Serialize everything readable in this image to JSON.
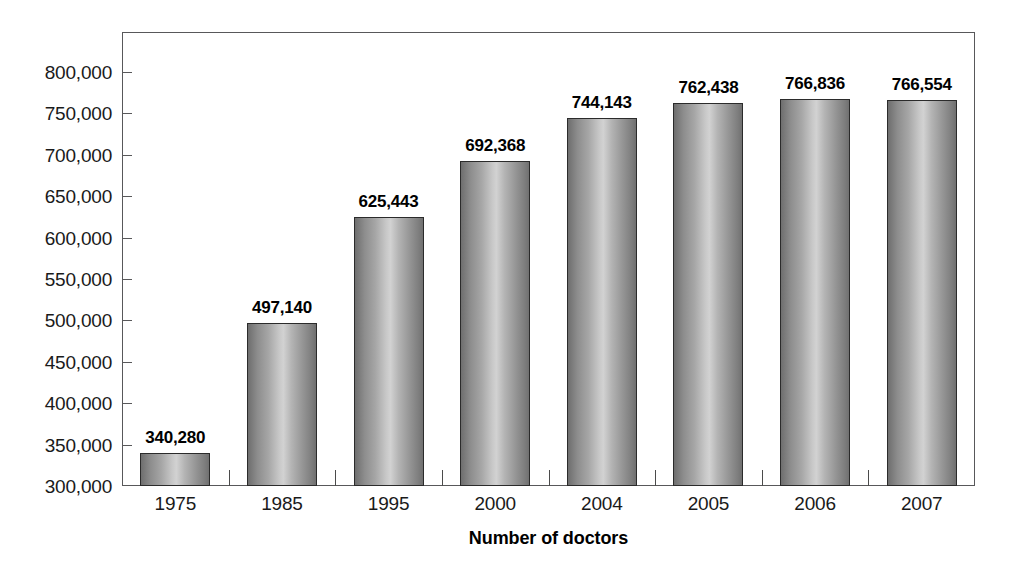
{
  "chart_data": {
    "type": "bar",
    "title": "",
    "xlabel": "Number of doctors",
    "ylabel": "",
    "categories": [
      "1975",
      "1985",
      "1995",
      "2000",
      "2004",
      "2005",
      "2006",
      "2007"
    ],
    "values": [
      340280,
      497140,
      625443,
      692368,
      744143,
      762438,
      766836,
      766554
    ],
    "value_labels": [
      "340,280",
      "497,140",
      "625,443",
      "692,368",
      "744,143",
      "762,438",
      "766,836",
      "766,554"
    ],
    "ylim": [
      300000,
      800000
    ],
    "ytick_values": [
      300000,
      350000,
      400000,
      450000,
      500000,
      550000,
      600000,
      650000,
      700000,
      750000,
      800000
    ],
    "ytick_labels": [
      "300,000",
      "350,000",
      "400,000",
      "450,000",
      "500,000",
      "550,000",
      "600,000",
      "650,000",
      "700,000",
      "750,000",
      "800,000"
    ],
    "grid": false,
    "legend": false,
    "legend_position": "none",
    "bar_style": "cylindrical-gradient-grayscale",
    "colors": {
      "bar_fill_light": "#d2d2d2",
      "bar_fill_dark": "#6e6e6e",
      "bar_border": "#2b2b2b",
      "axis": "#58585a",
      "text": "#1a1a1a",
      "background": "#ffffff"
    }
  }
}
